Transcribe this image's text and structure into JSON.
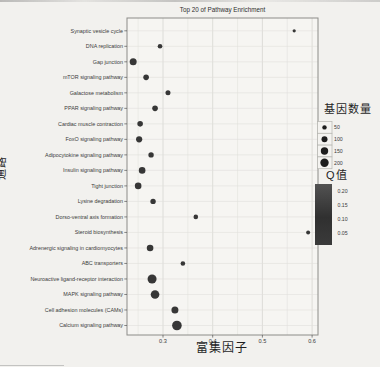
{
  "chart_data": {
    "type": "scatter",
    "title": "Top 20 of Pathway Enrichment",
    "xlabel": "富集因子",
    "ylabel": "通路",
    "xlim": [
      0.228,
      0.612
    ],
    "x_ticks": [
      0.3,
      0.4,
      0.5,
      0.6
    ],
    "x_tick_labels": [
      "0.3",
      "0.4",
      "0.5",
      "0.6"
    ],
    "x_minor_gridlines": [
      0.25,
      0.35,
      0.45,
      0.55
    ],
    "grid": true,
    "point_color": "#2c2c2c",
    "panel_border_color": "#8c8c88",
    "rows": [
      {
        "label": "Synaptic vesicle cycle",
        "enrichment_factor": 0.564,
        "radius_px": 1.6
      },
      {
        "label": "DNA replication",
        "enrichment_factor": 0.294,
        "radius_px": 2.3
      },
      {
        "label": "Gap junction",
        "enrichment_factor": 0.24,
        "radius_px": 3.5
      },
      {
        "label": "mTOR signaling pathway",
        "enrichment_factor": 0.266,
        "radius_px": 2.8
      },
      {
        "label": "Galactose metabolism",
        "enrichment_factor": 0.31,
        "radius_px": 2.5
      },
      {
        "label": "PPAR signaling pathway",
        "enrichment_factor": 0.284,
        "radius_px": 2.8
      },
      {
        "label": "Cardiac muscle contraction",
        "enrichment_factor": 0.254,
        "radius_px": 2.8
      },
      {
        "label": "FoxO signaling pathway",
        "enrichment_factor": 0.252,
        "radius_px": 3.1
      },
      {
        "label": "Adipocytokine signaling pathway",
        "enrichment_factor": 0.276,
        "radius_px": 2.7
      },
      {
        "label": "Insulin signaling pathway",
        "enrichment_factor": 0.258,
        "radius_px": 3.3
      },
      {
        "label": "Tight junction",
        "enrichment_factor": 0.25,
        "radius_px": 3.3
      },
      {
        "label": "Lysine degradation",
        "enrichment_factor": 0.28,
        "radius_px": 2.7
      },
      {
        "label": "Dorso-ventral axis formation",
        "enrichment_factor": 0.366,
        "radius_px": 2.3
      },
      {
        "label": "Steroid biosynthesis",
        "enrichment_factor": 0.592,
        "radius_px": 2.0
      },
      {
        "label": "Adrenergic signaling in cardiomyocytes",
        "enrichment_factor": 0.274,
        "radius_px": 3.3
      },
      {
        "label": "ABC transporters",
        "enrichment_factor": 0.34,
        "radius_px": 2.3
      },
      {
        "label": "Neuroactive ligand-receptor interaction",
        "enrichment_factor": 0.278,
        "radius_px": 4.5
      },
      {
        "label": "MAPK signaling pathway",
        "enrichment_factor": 0.284,
        "radius_px": 4.3
      },
      {
        "label": "Cell adhesion molecules (CAMs)",
        "enrichment_factor": 0.324,
        "radius_px": 3.5
      },
      {
        "label": "Calcium signaling pathway",
        "enrichment_factor": 0.328,
        "radius_px": 4.8
      }
    ],
    "legend_size": {
      "title": "基因数量",
      "entries": [
        {
          "label": "50",
          "radius_px": 2.2
        },
        {
          "label": "100",
          "radius_px": 3.0
        },
        {
          "label": "150",
          "radius_px": 3.7
        },
        {
          "label": "200",
          "radius_px": 4.2
        }
      ]
    },
    "legend_color": {
      "title": "Q值",
      "labels": [
        "0.20",
        "0.15",
        "0.10",
        "0.05"
      ],
      "gradient": [
        "#525252",
        "#303030"
      ]
    }
  }
}
